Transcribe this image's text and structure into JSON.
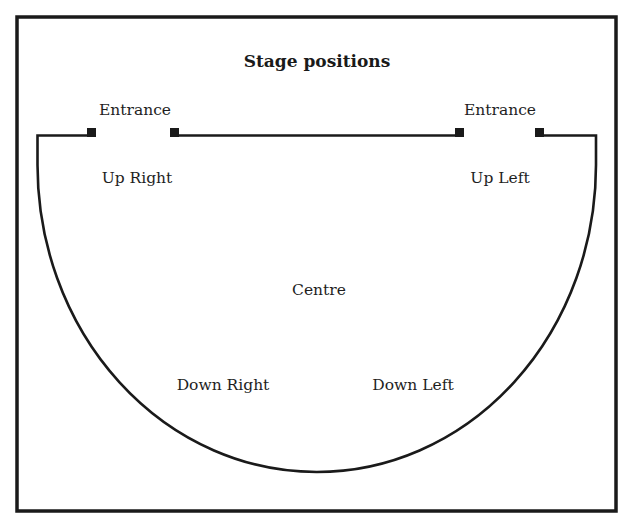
{
  "title": "Stage positions",
  "colors": {
    "background": "#ffffff",
    "ink": "#1a1a1a"
  },
  "entrances": {
    "left": {
      "label": "Entrance"
    },
    "right": {
      "label": "Entrance"
    }
  },
  "positions": {
    "up_right": "Up Right",
    "up_left": "Up Left",
    "centre": "Centre",
    "down_right": "Down Right",
    "down_left": "Down Left"
  }
}
